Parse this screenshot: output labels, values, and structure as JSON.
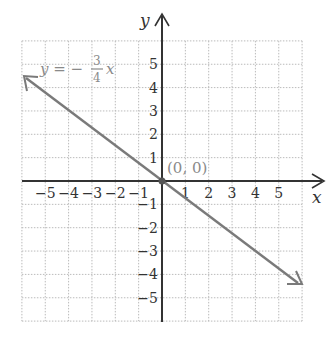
{
  "chart_data": {
    "type": "line",
    "title": "",
    "xlabel": "x",
    "ylabel": "y",
    "xlim": [
      -6,
      6
    ],
    "ylim": [
      -6,
      6
    ],
    "grid": true,
    "x_ticks": [
      "-5",
      "-4",
      "-3",
      "-2",
      "-1",
      "1",
      "2",
      "3",
      "4",
      "5"
    ],
    "y_ticks": [
      "5",
      "4",
      "3",
      "2",
      "1",
      "-1",
      "-2",
      "-3",
      "-4",
      "-5"
    ],
    "series": [
      {
        "name": "y = -3/4 x",
        "equation": "y = -3/4 x",
        "slope": -0.75,
        "intercept": 0,
        "x": [
          -6,
          6
        ],
        "y": [
          4.5,
          -4.5
        ],
        "color": "#7a7a7a"
      }
    ],
    "annotations": [
      {
        "label": "(0, 0)",
        "x": 0,
        "y": 0
      }
    ]
  },
  "labels": {
    "x_axis": "x",
    "y_axis": "y",
    "eq_lhs": "y = −",
    "eq_num": "3",
    "eq_den": "4",
    "eq_var": "x",
    "origin": "(0, 0)",
    "xt": [
      "−5",
      "−4",
      "−3",
      "−2",
      "−1",
      "1",
      "2",
      "3",
      "4",
      "5"
    ],
    "yt": [
      "5",
      "4",
      "3",
      "2",
      "1",
      "−1",
      "−2",
      "−3",
      "−4",
      "−5"
    ]
  },
  "colors": {
    "line": "#7a7a7a",
    "axis": "#333333",
    "grid": "#bbbbbb"
  }
}
